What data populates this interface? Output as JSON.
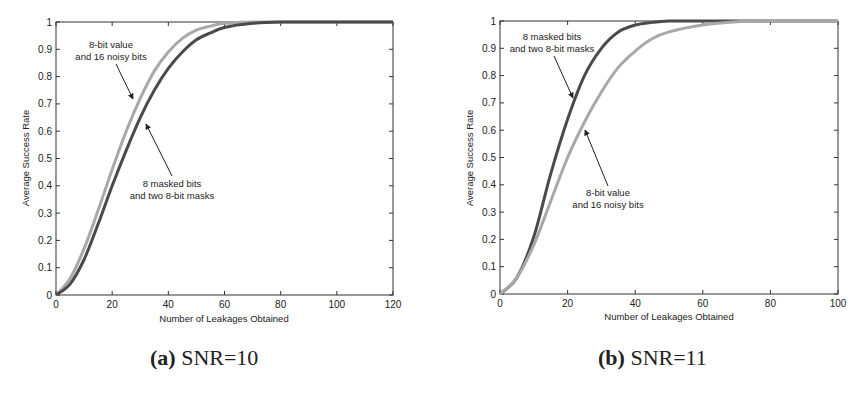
{
  "chart_data": [
    {
      "type": "line",
      "title": "",
      "caption_label": "(a)",
      "caption_text": "SNR=10",
      "xlabel": "Number of Leakages Obtained",
      "ylabel": "Average Success Rate",
      "xlim": [
        0,
        120
      ],
      "ylim": [
        0,
        1
      ],
      "xticks": [
        "0",
        "20",
        "40",
        "60",
        "80",
        "100",
        "120"
      ],
      "yticks": [
        "0",
        "0.1",
        "0.2",
        "0.3",
        "0.4",
        "0.5",
        "0.6",
        "0.7",
        "0.8",
        "0.9",
        "1"
      ],
      "grid": false,
      "x": [
        0,
        5,
        10,
        15,
        20,
        25,
        30,
        35,
        40,
        45,
        50,
        55,
        60,
        70,
        80,
        100,
        120
      ],
      "series": [
        {
          "name": "8-bit value and 16 noisy bits",
          "color": "#a8a8a8",
          "values": [
            0.0,
            0.06,
            0.17,
            0.31,
            0.46,
            0.6,
            0.72,
            0.82,
            0.89,
            0.94,
            0.97,
            0.985,
            0.995,
            1.0,
            1.0,
            1.0,
            1.0
          ]
        },
        {
          "name": "8 masked bits and two 8-bit masks",
          "color": "#4a4a4a",
          "values": [
            0.0,
            0.04,
            0.13,
            0.26,
            0.4,
            0.53,
            0.65,
            0.75,
            0.83,
            0.89,
            0.935,
            0.96,
            0.98,
            0.995,
            1.0,
            1.0,
            1.0
          ]
        }
      ],
      "annotations": [
        {
          "text": [
            "8-bit value",
            "and 16 noisy bits"
          ],
          "points_to": "8-bit value and 16 noisy bits"
        },
        {
          "text": [
            "8 masked bits",
            "and two 8-bit masks"
          ],
          "points_to": "8 masked bits and two 8-bit masks"
        }
      ]
    },
    {
      "type": "line",
      "title": "",
      "caption_label": "(b)",
      "caption_text": "SNR=11",
      "xlabel": "Number of Leakages Obtained",
      "ylabel": "Average Success Rate",
      "xlim": [
        0,
        100
      ],
      "ylim": [
        0,
        1
      ],
      "xticks": [
        "0",
        "20",
        "40",
        "60",
        "80",
        "100"
      ],
      "yticks": [
        "0",
        "0.1",
        "0.2",
        "0.3",
        "0.4",
        "0.5",
        "0.6",
        "0.7",
        "0.8",
        "0.9",
        "1"
      ],
      "grid": false,
      "x": [
        0,
        5,
        10,
        15,
        20,
        25,
        30,
        35,
        40,
        45,
        50,
        60,
        70,
        80,
        100
      ],
      "series": [
        {
          "name": "8 masked bits and two 8-bit masks",
          "color": "#4a4a4a",
          "values": [
            0.0,
            0.06,
            0.21,
            0.44,
            0.64,
            0.8,
            0.9,
            0.96,
            0.985,
            0.995,
            1.0,
            1.0,
            1.0,
            1.0,
            1.0
          ]
        },
        {
          "name": "8-bit value and 16 noisy bits",
          "color": "#a8a8a8",
          "values": [
            0.0,
            0.06,
            0.18,
            0.34,
            0.5,
            0.63,
            0.74,
            0.83,
            0.89,
            0.935,
            0.96,
            0.985,
            0.997,
            1.0,
            1.0
          ]
        }
      ],
      "annotations": [
        {
          "text": [
            "8 masked bits",
            "and two 8-bit masks"
          ],
          "points_to": "8 masked bits and two 8-bit masks"
        },
        {
          "text": [
            "8-bit value",
            "and 16 noisy bits"
          ],
          "points_to": "8-bit value and 16 noisy bits"
        }
      ]
    }
  ]
}
